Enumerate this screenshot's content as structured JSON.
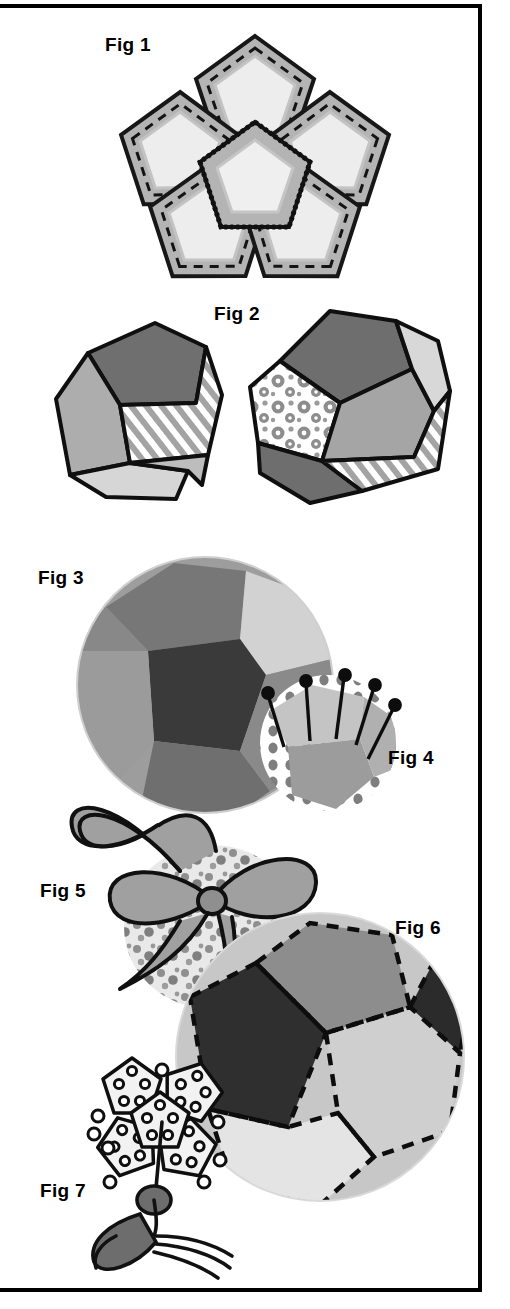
{
  "page": {
    "kind": "instructional-craft-diagram",
    "title_visible": false,
    "background_color": "#ffffff",
    "ink_color": "#000000",
    "border": {
      "style": "solid rectangle",
      "color": "#000000",
      "width_px": 4
    }
  },
  "palette": {
    "black": "#1a1a1a",
    "dark_gray": "#6b6b6b",
    "mid_gray": "#9a9a9a",
    "light_gray": "#c9c9c9",
    "pale_gray": "#e3e3e3",
    "white": "#ffffff",
    "stitch": "#111111"
  },
  "figures": [
    {
      "id": "fig1",
      "label": "Fig 1",
      "caption_position": "top-left",
      "description": "Flat pentagon flower: one central pentagon with five pentagons joined around it, seam allowances shown with dashed stitching lines and a zig-zag whip-stitched centre seam."
    },
    {
      "id": "fig2",
      "label": "Fig 2",
      "caption_position": "top-center",
      "description": "Two partly-assembled dodecahedron shapes: a half bowl of five pentagons on the left and a fuller ball with patterned, striped and solid pentagons on the right."
    },
    {
      "id": "fig3",
      "label": "Fig 3",
      "caption_position": "top-left",
      "description": "Completed stuffed patchwork ball made from twelve pentagons in assorted tones."
    },
    {
      "id": "fig4",
      "label": "Fig 4",
      "caption_position": "right",
      "description": "Small spotted pentagon ball held with five straight pins pushed into the top face."
    },
    {
      "id": "fig5",
      "label": "Fig 5",
      "caption_position": "left",
      "description": "Patterned ball tied with a wide ribbon finished in a bow with long trailing tails."
    },
    {
      "id": "fig6",
      "label": "Fig 6",
      "caption_position": "top-right",
      "description": "Large ball shown with dashed top-stitch lines along every pentagon seam."
    },
    {
      "id": "fig7",
      "label": "Fig 7",
      "caption_position": "left",
      "description": "Miniature beaded pentagon ball hanging from a twisted cord with a tassel."
    }
  ],
  "labels": {
    "fig1": "Fig 1",
    "fig2": "Fig 2",
    "fig3": "Fig 3",
    "fig4": "Fig 4",
    "fig5": "Fig 5",
    "fig6": "Fig 6",
    "fig7": "Fig 7"
  }
}
